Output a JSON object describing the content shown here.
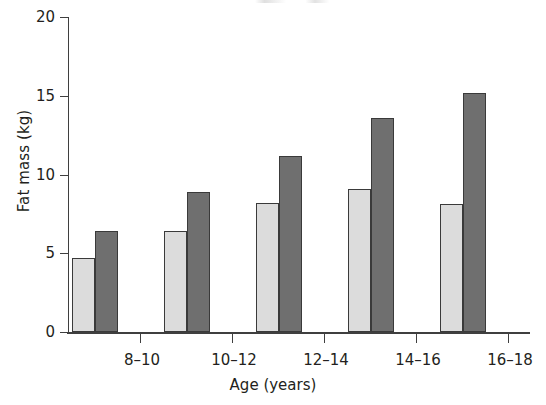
{
  "chart_data": {
    "type": "bar",
    "title": "",
    "xlabel": "Age (years)",
    "ylabel": "Fat mass (kg)",
    "categories": [
      "8–10",
      "10–12",
      "12–14",
      "14–16",
      "16–18"
    ],
    "ylim": [
      0,
      20
    ],
    "yticks": [
      0,
      5,
      10,
      15,
      20
    ],
    "ytick_labels": [
      "0",
      "5",
      "10",
      "15",
      "20"
    ],
    "grid": false,
    "legend": "none",
    "series": [
      {
        "name": "light-series",
        "color": "#dcdcdc",
        "values": [
          4.7,
          6.4,
          8.2,
          9.1,
          8.1
        ]
      },
      {
        "name": "dark-series",
        "color": "#6f6f6f",
        "values": [
          6.4,
          8.9,
          11.2,
          13.6,
          15.2
        ]
      }
    ]
  },
  "axis": {
    "y_title": "Fat mass (kg)",
    "x_title": "Age (years)"
  }
}
